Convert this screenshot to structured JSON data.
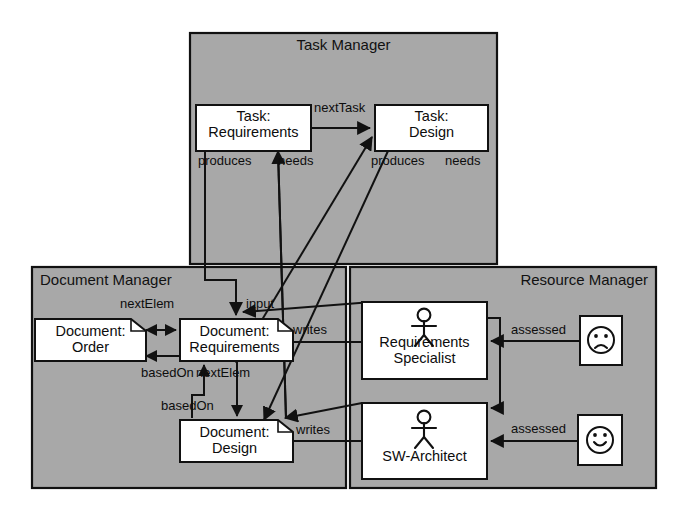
{
  "diagram": {
    "type": "uml-component-collaboration",
    "background": "#ffffff",
    "panel_fill": "#a8a8a8",
    "node_fill": "#ffffff",
    "stroke": "#111111"
  },
  "panels": [
    {
      "id": "task-manager",
      "title": "Task Manager",
      "x": 190,
      "y": 33,
      "w": 307,
      "h": 231,
      "title_align": "center"
    },
    {
      "id": "document-manager",
      "title": "Document Manager",
      "x": 32,
      "y": 267,
      "w": 314,
      "h": 221,
      "title_align": "left"
    },
    {
      "id": "resource-manager",
      "title": "Resource Manager",
      "x": 350,
      "y": 267,
      "w": 306,
      "h": 221,
      "title_align": "right"
    }
  ],
  "nodes": [
    {
      "id": "task-requirements",
      "kind": "task",
      "line1": "Task:",
      "line2": "Requirements",
      "x": 196,
      "y": 105,
      "w": 115,
      "h": 46
    },
    {
      "id": "task-design",
      "kind": "task",
      "line1": "Task:",
      "line2": "Design",
      "x": 375,
      "y": 105,
      "w": 113,
      "h": 46
    },
    {
      "id": "document-order",
      "kind": "document",
      "line1": "Document:",
      "line2": "Order",
      "x": 35,
      "y": 319,
      "w": 111,
      "h": 42
    },
    {
      "id": "document-requirements",
      "kind": "document",
      "line1": "Document:",
      "line2": "Requirements",
      "x": 180,
      "y": 319,
      "w": 113,
      "h": 42
    },
    {
      "id": "document-design",
      "kind": "document",
      "line1": "Document:",
      "line2": "Design",
      "x": 180,
      "y": 420,
      "w": 113,
      "h": 42
    },
    {
      "id": "requirements-specialist",
      "kind": "actor",
      "line1": "Requirements",
      "line2": "Specialist",
      "x": 362,
      "y": 302,
      "w": 125,
      "h": 77
    },
    {
      "id": "sw-architect",
      "kind": "actor",
      "line1": "SW-Architect",
      "line2": "",
      "x": 362,
      "y": 403,
      "w": 125,
      "h": 76
    },
    {
      "id": "assessment-sad",
      "kind": "face-sad",
      "line1": "",
      "line2": "",
      "x": 580,
      "y": 316,
      "w": 42,
      "h": 49
    },
    {
      "id": "assessment-happy",
      "kind": "face-happy",
      "line1": "",
      "line2": "",
      "x": 578,
      "y": 415,
      "w": 44,
      "h": 50
    }
  ],
  "edge_labels": [
    {
      "id": "next-task",
      "text": "nextTask",
      "x": 314,
      "y": 100
    },
    {
      "id": "produces-req",
      "text": "produces",
      "x": 198,
      "y": 153
    },
    {
      "id": "needs-req",
      "text": "needs",
      "x": 278,
      "y": 153
    },
    {
      "id": "produces-des",
      "text": "produces",
      "x": 371,
      "y": 153
    },
    {
      "id": "needs-des",
      "text": "needs",
      "x": 445,
      "y": 153
    },
    {
      "id": "next-elem-top",
      "text": "nextElem",
      "x": 120,
      "y": 296
    },
    {
      "id": "input",
      "text": "input",
      "x": 246,
      "y": 296
    },
    {
      "id": "writes-req",
      "text": "writes",
      "x": 293,
      "y": 322
    },
    {
      "id": "assessed-top",
      "text": "assessed",
      "x": 511,
      "y": 322
    },
    {
      "id": "based-on-top",
      "text": "basedOn",
      "x": 141,
      "y": 365
    },
    {
      "id": "next-elem-mid",
      "text": "nextElem",
      "x": 196,
      "y": 365
    },
    {
      "id": "based-on-low",
      "text": "basedOn",
      "x": 161,
      "y": 398
    },
    {
      "id": "writes-des",
      "text": "writes",
      "x": 296,
      "y": 422
    },
    {
      "id": "assessed-low",
      "text": "assessed",
      "x": 511,
      "y": 421
    }
  ],
  "edges": [
    {
      "id": "e-next-task",
      "label": "nextTask",
      "from": "task-requirements",
      "to": "task-design"
    },
    {
      "id": "e-produces-req",
      "label": "produces",
      "from": "task-requirements",
      "to": "document-requirements"
    },
    {
      "id": "e-needs-req",
      "label": "needs",
      "from": "document-design",
      "to": "task-requirements"
    },
    {
      "id": "e-produces-des",
      "label": "produces",
      "from": "task-design",
      "to": "document-design"
    },
    {
      "id": "e-needs-des",
      "label": "needs",
      "from": "document-requirements",
      "to": "task-design"
    },
    {
      "id": "e-input",
      "label": "input",
      "from": "requirements-specialist",
      "to": "document-requirements"
    },
    {
      "id": "e-next-elem-top",
      "label": "nextElem",
      "from": "document-order",
      "to": "document-requirements"
    },
    {
      "id": "e-based-on-top",
      "label": "basedOn",
      "from": "document-requirements",
      "to": "document-order"
    },
    {
      "id": "e-next-elem-mid",
      "label": "nextElem",
      "from": "document-requirements",
      "to": "document-design"
    },
    {
      "id": "e-based-on-low",
      "label": "basedOn",
      "from": "document-design",
      "to": "document-requirements"
    },
    {
      "id": "e-writes-req",
      "label": "writes",
      "from": "requirements-specialist",
      "to": "document-requirements"
    },
    {
      "id": "e-writes-des",
      "label": "writes",
      "from": "sw-architect",
      "to": "document-design"
    },
    {
      "id": "e-assessed-top",
      "label": "assessed",
      "from": "assessment-sad",
      "to": "requirements-specialist"
    },
    {
      "id": "e-assessed-low",
      "label": "assessed",
      "from": "assessment-happy",
      "to": "sw-architect"
    },
    {
      "id": "e-spec-to-arch",
      "label": "",
      "from": "requirements-specialist",
      "to": "sw-architect"
    }
  ]
}
